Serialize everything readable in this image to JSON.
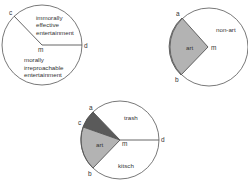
{
  "colors": {
    "stroke": "#555555",
    "art_fill": "#b3b3b3",
    "dark_fill": "#5a5a5a",
    "background": "#ffffff"
  },
  "diagram1": {
    "points": {
      "c": "c",
      "m": "m",
      "d": "d"
    },
    "regions": {
      "upper": [
        "immorally",
        "effective",
        "entertainment"
      ],
      "lower": [
        "morally",
        "irreproachable",
        "entertainment"
      ]
    }
  },
  "diagram2": {
    "points": {
      "a": "a",
      "b": "b",
      "m": "m"
    },
    "regions": {
      "art": "art",
      "non_art": "non-art"
    }
  },
  "diagram3": {
    "points": {
      "a": "a",
      "c": "c",
      "b": "b",
      "m": "m",
      "d": "d"
    },
    "regions": {
      "trash": "trash",
      "art": "art",
      "kitsch": "kitsch"
    }
  }
}
